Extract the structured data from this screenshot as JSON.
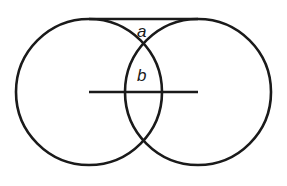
{
  "diagram": {
    "colors": {
      "stroke": "#1a1a1a",
      "background": "#ffffff"
    },
    "circles": [
      {
        "name": "left-circle",
        "cx": 89,
        "cy": 92,
        "r": 73
      },
      {
        "name": "right-circle",
        "cx": 198,
        "cy": 92,
        "r": 73
      }
    ],
    "tangent_line": {
      "x1": 89,
      "y1": 19,
      "x2": 198,
      "y2": 19
    },
    "center_line": {
      "x1": 89,
      "y1": 92,
      "x2": 198,
      "y2": 92
    },
    "labels": {
      "a": {
        "text": "a",
        "x": 137,
        "y": 37
      },
      "b": {
        "text": "b",
        "x": 137,
        "y": 81
      }
    }
  }
}
